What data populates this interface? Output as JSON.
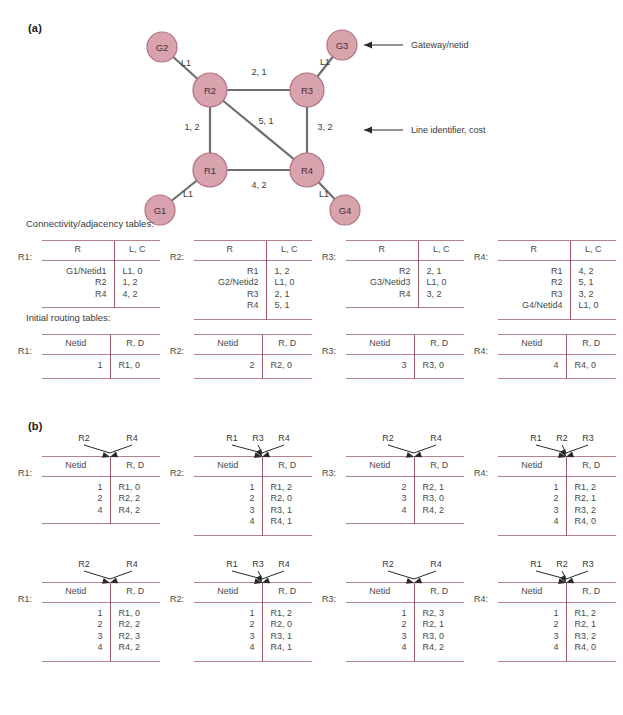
{
  "panels": {
    "a_label": "(a)",
    "b_label": "(b)"
  },
  "captions": {
    "connectivity": "Connectivity/adjacency tables:",
    "initial_routing": "Initial routing tables:"
  },
  "colors": {
    "node_fill": "#d9a3ad",
    "node_stroke": "#b0737f",
    "edge": "#6e6e6e",
    "table_rule": "#b38490",
    "table_divider": "#9c5a68",
    "text": "#3a3a3a"
  },
  "network": {
    "annotations": [
      {
        "name": "gateway-netid",
        "text": "Gateway/netid"
      },
      {
        "name": "line-identifier-cost",
        "text": "Line identifier, cost"
      }
    ],
    "nodes": [
      {
        "id": "G2",
        "label": "G2",
        "x": 42,
        "y": 27,
        "r": 15,
        "kind": "gateway"
      },
      {
        "id": "G3",
        "label": "G3",
        "x": 222,
        "y": 25,
        "r": 15,
        "kind": "gateway"
      },
      {
        "id": "G1",
        "label": "G1",
        "x": 40,
        "y": 190,
        "r": 15,
        "kind": "gateway"
      },
      {
        "id": "G4",
        "label": "G4",
        "x": 225,
        "y": 190,
        "r": 15,
        "kind": "gateway"
      },
      {
        "id": "R2",
        "label": "R2",
        "x": 90,
        "y": 70,
        "r": 17,
        "kind": "router"
      },
      {
        "id": "R3",
        "label": "R3",
        "x": 187,
        "y": 70,
        "r": 17,
        "kind": "router"
      },
      {
        "id": "R1",
        "label": "R1",
        "x": 90,
        "y": 150,
        "r": 17,
        "kind": "router"
      },
      {
        "id": "R4",
        "label": "R4",
        "x": 187,
        "y": 150,
        "r": 17,
        "kind": "router"
      }
    ],
    "edges": [
      {
        "from": "G2",
        "to": "R2",
        "label": "L1",
        "lx": 66,
        "ly": 46
      },
      {
        "from": "G3",
        "to": "R3",
        "label": "L1",
        "lx": 205,
        "ly": 45
      },
      {
        "from": "G1",
        "to": "R1",
        "label": "L1",
        "lx": 68,
        "ly": 177
      },
      {
        "from": "G4",
        "to": "R4",
        "label": "L1",
        "lx": 204,
        "ly": 177
      },
      {
        "from": "R2",
        "to": "R3",
        "label": "2, 1",
        "lx": 139,
        "ly": 55
      },
      {
        "from": "R2",
        "to": "R1",
        "label": "1, 2",
        "lx": 72,
        "ly": 110
      },
      {
        "from": "R3",
        "to": "R4",
        "label": "3, 2",
        "lx": 205,
        "ly": 110
      },
      {
        "from": "R2",
        "to": "R4",
        "label": "5, 1",
        "lx": 146,
        "ly": 104
      },
      {
        "from": "R1",
        "to": "R4",
        "label": "4, 2",
        "lx": 139,
        "ly": 168
      }
    ]
  },
  "connectivity_tables": [
    {
      "router": "R1:",
      "headers": [
        "R",
        "L, C"
      ],
      "rows": [
        [
          "G1/Netid1",
          "L1, 0"
        ],
        [
          "R2",
          "1, 2"
        ],
        [
          "R4",
          "4, 2"
        ]
      ]
    },
    {
      "router": "R2:",
      "headers": [
        "R",
        "L, C"
      ],
      "rows": [
        [
          "R1",
          "1, 2"
        ],
        [
          "G2/Netid2",
          "L1, 0"
        ],
        [
          "R3",
          "2, 1"
        ],
        [
          "R4",
          "5, 1"
        ]
      ]
    },
    {
      "router": "R3:",
      "headers": [
        "R",
        "L, C"
      ],
      "rows": [
        [
          "R2",
          "2, 1"
        ],
        [
          "G3/Netid3",
          "L1, 0"
        ],
        [
          "R4",
          "3, 2"
        ]
      ]
    },
    {
      "router": "R4:",
      "headers": [
        "R",
        "L, C"
      ],
      "rows": [
        [
          "R1",
          "4, 2"
        ],
        [
          "R2",
          "5, 1"
        ],
        [
          "R3",
          "3, 2"
        ],
        [
          "G4/Netid4",
          "L1, 0"
        ]
      ]
    }
  ],
  "initial_routing_tables": [
    {
      "router": "R1:",
      "headers": [
        "Netid",
        "R, D"
      ],
      "rows": [
        [
          "1",
          "R1, 0"
        ]
      ]
    },
    {
      "router": "R2:",
      "headers": [
        "Netid",
        "R, D"
      ],
      "rows": [
        [
          "2",
          "R2, 0"
        ]
      ]
    },
    {
      "router": "R3:",
      "headers": [
        "Netid",
        "R, D"
      ],
      "rows": [
        [
          "3",
          "R3, 0"
        ]
      ]
    },
    {
      "router": "R4:",
      "headers": [
        "Netid",
        "R, D"
      ],
      "rows": [
        [
          "4",
          "R4, 0"
        ]
      ]
    }
  ],
  "exchange_round1": [
    {
      "router": "R1:",
      "sources": [
        "R2",
        "R4"
      ],
      "headers": [
        "Netid",
        "R, D"
      ],
      "rows": [
        [
          "1",
          "R1, 0"
        ],
        [
          "2",
          "R2, 2"
        ],
        [
          "4",
          "R4, 2"
        ]
      ]
    },
    {
      "router": "R2:",
      "sources": [
        "R1",
        "R3",
        "R4"
      ],
      "headers": [
        "Netid",
        "R, D"
      ],
      "rows": [
        [
          "1",
          "R1, 2"
        ],
        [
          "2",
          "R2, 0"
        ],
        [
          "3",
          "R3, 1"
        ],
        [
          "4",
          "R4, 1"
        ]
      ]
    },
    {
      "router": "R3:",
      "sources": [
        "R2",
        "R4"
      ],
      "headers": [
        "Netid",
        "R, D"
      ],
      "rows": [
        [
          "2",
          "R2, 1"
        ],
        [
          "3",
          "R3, 0"
        ],
        [
          "4",
          "R4, 2"
        ]
      ]
    },
    {
      "router": "R4:",
      "sources": [
        "R1",
        "R2",
        "R3"
      ],
      "headers": [
        "Netid",
        "R, D"
      ],
      "rows": [
        [
          "1",
          "R1, 2"
        ],
        [
          "2",
          "R2, 1"
        ],
        [
          "3",
          "R3, 2"
        ],
        [
          "4",
          "R4, 0"
        ]
      ]
    }
  ],
  "exchange_round2": [
    {
      "router": "R1:",
      "sources": [
        "R2",
        "R4"
      ],
      "headers": [
        "Netid",
        "R, D"
      ],
      "rows": [
        [
          "1",
          "R1, 0"
        ],
        [
          "2",
          "R2, 2"
        ],
        [
          "3",
          "R2, 3"
        ],
        [
          "4",
          "R4, 2"
        ]
      ]
    },
    {
      "router": "R2:",
      "sources": [
        "R1",
        "R3",
        "R4"
      ],
      "headers": [
        "Netid",
        "R, D"
      ],
      "rows": [
        [
          "1",
          "R1, 2"
        ],
        [
          "2",
          "R2, 0"
        ],
        [
          "3",
          "R3, 1"
        ],
        [
          "4",
          "R4, 1"
        ]
      ]
    },
    {
      "router": "R3:",
      "sources": [
        "R2",
        "R4"
      ],
      "headers": [
        "Netid",
        "R, D"
      ],
      "rows": [
        [
          "1",
          "R2, 3"
        ],
        [
          "2",
          "R2, 1"
        ],
        [
          "3",
          "R3, 0"
        ],
        [
          "4",
          "R4, 2"
        ]
      ]
    },
    {
      "router": "R4:",
      "sources": [
        "R1",
        "R2",
        "R3"
      ],
      "headers": [
        "Netid",
        "R, D"
      ],
      "rows": [
        [
          "1",
          "R1, 2"
        ],
        [
          "2",
          "R2, 1"
        ],
        [
          "3",
          "R3, 2"
        ],
        [
          "4",
          "R4, 0"
        ]
      ]
    }
  ]
}
